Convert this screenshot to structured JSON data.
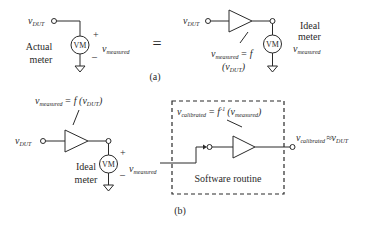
{
  "part_a": {
    "caption": "(a)",
    "equals_sign": "=",
    "left": {
      "input_label": "v",
      "input_sub": "DUT",
      "meter_label": "VM",
      "meter_name_line1": "Actual",
      "meter_name_line2": "meter",
      "plus": "+",
      "minus": "–",
      "output_label": "v",
      "output_sub": "measured"
    },
    "right": {
      "input_label": "v",
      "input_sub": "DUT",
      "meter_label": "VM",
      "meter_name_line1": "Ideal",
      "meter_name_line2": "meter",
      "output_label": "v",
      "output_sub": "measured",
      "equation_v": "v",
      "equation_sub": "measured",
      "equation_eq": "= f",
      "equation_line2_open": "(v",
      "equation_line2_sub": "DUT",
      "equation_line2_close": ")"
    }
  },
  "part_b": {
    "caption": "(b)",
    "input_label": "v",
    "input_sub": "DUT",
    "equation_v": "v",
    "equation_sub": "measured",
    "equation_rest": "= f (v",
    "equation_rest_sub": "DUT",
    "equation_close": ")",
    "meter_label": "VM",
    "meter_name_line1": "Ideal",
    "meter_name_line2": "meter",
    "plus": "+",
    "minus": "–",
    "measured_label": "v",
    "measured_sub": "measured",
    "software_box": {
      "title": "Software routine",
      "equation_v": "v",
      "equation_sub": "calibrated",
      "equation_eq": "= f",
      "equation_sup": "-1",
      "equation_open": "(v",
      "equation_open_sub": "measured",
      "equation_close": ")"
    },
    "output_label": "v",
    "output_sub": "calibrated",
    "output_approx": "≈v",
    "output_approx_sub": "DUT"
  }
}
